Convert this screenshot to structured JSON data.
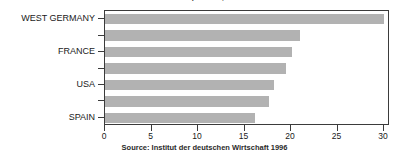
{
  "chart_data": {
    "type": "bar",
    "orientation": "horizontal",
    "title": "DM per hour, male and female workers",
    "xlabel": "",
    "ylabel": "",
    "categories": [
      "WEST GERMANY",
      "",
      "FRANCE",
      "",
      "USA",
      "",
      "SPAIN"
    ],
    "values": [
      30.0,
      21.0,
      20.1,
      19.5,
      18.2,
      17.6,
      16.1
    ],
    "xlim": [
      0,
      30
    ],
    "xticks": [
      0,
      5,
      10,
      15,
      20,
      25,
      30
    ],
    "xtick_labels": [
      "0",
      "5",
      "10",
      "15",
      "20",
      "25",
      "30"
    ],
    "grid": false,
    "legend": null,
    "bar_color": "#b2b2b2",
    "axis_color": "#3b3b3b",
    "background": "#ffffff",
    "source": "Source: Institut der deutschen Wirtschaft 1996"
  },
  "axis_labels": {
    "visible": [
      {
        "text": "WEST GERMANY",
        "row": 0
      },
      {
        "text": "FRANCE",
        "row": 2
      },
      {
        "text": "USA",
        "row": 4
      },
      {
        "text": "SPAIN",
        "row": 6
      }
    ]
  }
}
